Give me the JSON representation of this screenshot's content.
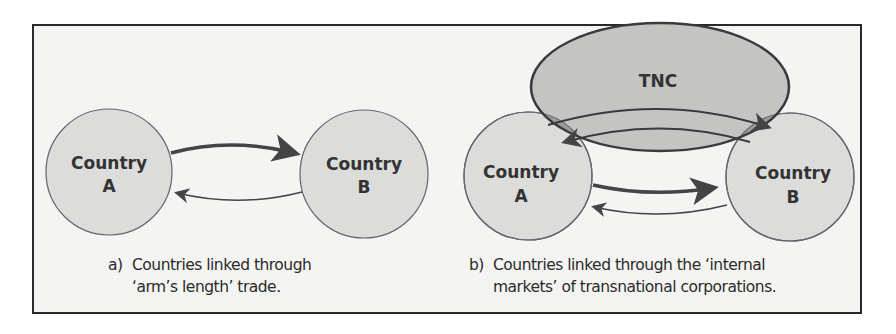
{
  "figure": {
    "panel_a": {
      "label": "a)",
      "caption_line1": "Countries linked through",
      "caption_line2": "‘arm’s length’ trade.",
      "node_a": {
        "line1": "Country",
        "line2": "A"
      },
      "node_b": {
        "line1": "Country",
        "line2": "B"
      }
    },
    "panel_b": {
      "label": "b)",
      "caption_line1": "Countries linked through the ‘internal",
      "caption_line2": "markets’ of transnational corporations.",
      "tnc": "TNC",
      "node_a": {
        "line1": "Country",
        "line2": "A"
      },
      "node_b": {
        "line1": "Country",
        "line2": "B"
      }
    },
    "colors": {
      "circle_fill": "#dcdcda",
      "overlap_fill": "#9c9c9a",
      "tnc_fill": "#c2c2c0",
      "stroke": "#555555",
      "arrow": "#444444",
      "background": "#f4f4f2"
    }
  }
}
